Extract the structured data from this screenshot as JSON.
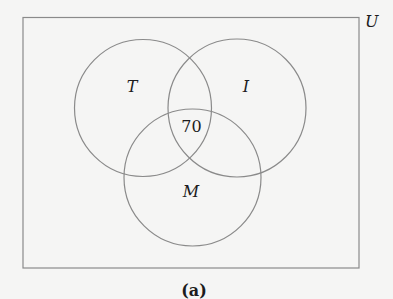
{
  "diagram": {
    "type": "venn",
    "universe_label": "U",
    "sets": [
      {
        "name": "T",
        "label": "T"
      },
      {
        "name": "I",
        "label": "I"
      },
      {
        "name": "M",
        "label": "M"
      }
    ],
    "regions": {
      "T_and_I_and_M": "70"
    },
    "caption": "(a)",
    "colors": {
      "stroke": "#8a8a8a",
      "text": "#1c1c1c",
      "background": "#f5f5f4"
    }
  }
}
